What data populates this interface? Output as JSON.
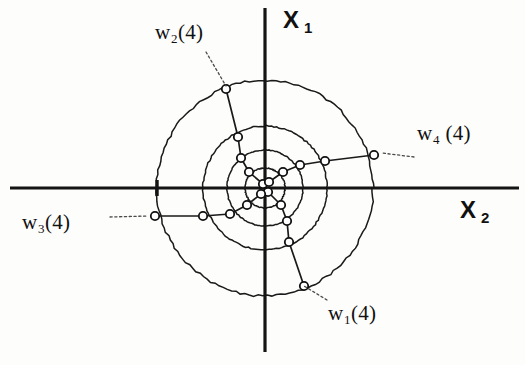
{
  "figure": {
    "kind": "scatter",
    "background_color": "#fdfdfb",
    "ink_color": "#141414",
    "node_fill_color": "#ffffff"
  },
  "axes": {
    "origin": {
      "x": 265,
      "y": 188
    },
    "vertical": {
      "name": "x1-axis",
      "label": "X",
      "subscript": "1",
      "x": 265,
      "y_top": 8,
      "y_bottom": 352
    },
    "horizontal": {
      "name": "x2-axis",
      "label": "X",
      "subscript": "2",
      "y": 188,
      "x_left": 10,
      "x_right": 519
    },
    "ticks": [
      {
        "name": "left-tick",
        "x": 157,
        "y": 188,
        "length": 16
      }
    ]
  },
  "rings": [
    {
      "name": "ring-inner",
      "radius": 20
    },
    {
      "name": "ring-second",
      "radius": 38
    },
    {
      "name": "ring-third",
      "radius": 62
    },
    {
      "name": "ring-outer",
      "radius": 108
    }
  ],
  "labels": [
    {
      "id": "w2-label",
      "name": "w2-label",
      "base": "w",
      "subscript": "2",
      "suffix": "(4)",
      "text": "w2(4)",
      "leader": {
        "x1": 206,
        "y1": 52,
        "x2": 226,
        "y2": 86
      }
    },
    {
      "id": "w4-label",
      "name": "w4-label",
      "base": "w",
      "subscript": "4",
      "suffix": " (4)",
      "text": "w4 (4)",
      "leader": {
        "x1": 414,
        "y1": 157,
        "x2": 382,
        "y2": 153
      }
    },
    {
      "id": "w3-label",
      "name": "w3-label",
      "base": "w",
      "subscript": "3",
      "suffix": "(4)",
      "text": "w3(4)",
      "leader": {
        "x1": 110,
        "y1": 217,
        "x2": 148,
        "y2": 216
      }
    },
    {
      "id": "w1-label",
      "name": "w1-label",
      "base": "w",
      "subscript": "1",
      "suffix": "(4)",
      "text": "w1(4)",
      "leader": {
        "x1": 327,
        "y1": 300,
        "x2": 304,
        "y2": 286
      }
    }
  ],
  "chart_data": {
    "type": "scatter",
    "title": "",
    "xlabel": "X 2",
    "ylabel": "X 1",
    "grid": false,
    "legend": false,
    "center": {
      "x": 265,
      "y": 188
    },
    "ring_radii": [
      20,
      38,
      62,
      108
    ],
    "series": [
      {
        "name": "w1(4)",
        "label_anchor": {
          "x": 304,
          "y": 286
        },
        "points": [
          {
            "x": 304,
            "y": 286
          },
          {
            "x": 289,
            "y": 242
          },
          {
            "x": 287,
            "y": 221
          },
          {
            "x": 281,
            "y": 205
          },
          {
            "x": 268,
            "y": 192
          }
        ]
      },
      {
        "name": "w2(4)",
        "label_anchor": {
          "x": 226,
          "y": 89
        },
        "points": [
          {
            "x": 226,
            "y": 89
          },
          {
            "x": 238,
            "y": 137
          },
          {
            "x": 241,
            "y": 158
          },
          {
            "x": 249,
            "y": 172
          },
          {
            "x": 263,
            "y": 184
          }
        ]
      },
      {
        "name": "w3(4)",
        "label_anchor": {
          "x": 155,
          "y": 216
        },
        "points": [
          {
            "x": 155,
            "y": 216
          },
          {
            "x": 203,
            "y": 216
          },
          {
            "x": 230,
            "y": 214
          },
          {
            "x": 247,
            "y": 205
          },
          {
            "x": 261,
            "y": 194
          }
        ]
      },
      {
        "name": "w4(4)",
        "label_anchor": {
          "x": 374,
          "y": 155
        },
        "points": [
          {
            "x": 374,
            "y": 155
          },
          {
            "x": 325,
            "y": 161
          },
          {
            "x": 300,
            "y": 165
          },
          {
            "x": 283,
            "y": 172
          },
          {
            "x": 269,
            "y": 182
          }
        ]
      }
    ]
  }
}
